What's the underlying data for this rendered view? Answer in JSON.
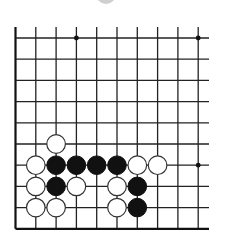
{
  "board": {
    "type": "go-board-fragment",
    "columns": 10,
    "rows": 10,
    "origin_x": 15.5,
    "origin_y": 38,
    "spacing_x": 20.3,
    "spacing_y": 21.2,
    "vertical_line_top": 27,
    "horizontal_line_right": 209,
    "left_edge_is_board_edge": true,
    "bottom_edge_is_board_edge": true,
    "colors": {
      "line": "#222222",
      "black_stone": "#111111",
      "white_stone_fill": "#ffffff",
      "white_stone_stroke": "#333333",
      "ghost_stone": "#cfcfcf",
      "background": "#ffffff"
    }
  },
  "star_points": [
    {
      "col": 3,
      "row": 0
    },
    {
      "col": 9,
      "row": 0
    },
    {
      "col": 9,
      "row": 6
    }
  ],
  "stones": [
    {
      "color": "white",
      "col": 2,
      "row": 5
    },
    {
      "color": "white",
      "col": 1,
      "row": 6
    },
    {
      "color": "black",
      "col": 2,
      "row": 6
    },
    {
      "color": "black",
      "col": 3,
      "row": 6
    },
    {
      "color": "black",
      "col": 4,
      "row": 6
    },
    {
      "color": "black",
      "col": 5,
      "row": 6
    },
    {
      "color": "white",
      "col": 6,
      "row": 6
    },
    {
      "color": "white",
      "col": 7,
      "row": 6
    },
    {
      "color": "white",
      "col": 1,
      "row": 7
    },
    {
      "color": "black",
      "col": 2,
      "row": 7
    },
    {
      "color": "white",
      "col": 3,
      "row": 7
    },
    {
      "color": "white",
      "col": 5,
      "row": 7
    },
    {
      "color": "black",
      "col": 6,
      "row": 7
    },
    {
      "color": "white",
      "col": 1,
      "row": 8
    },
    {
      "color": "white",
      "col": 2,
      "row": 8
    },
    {
      "color": "white",
      "col": 5,
      "row": 8
    },
    {
      "color": "black",
      "col": 6,
      "row": 8
    }
  ],
  "ghost_marker": {
    "cx": 106,
    "cy": -6,
    "r": 10
  }
}
